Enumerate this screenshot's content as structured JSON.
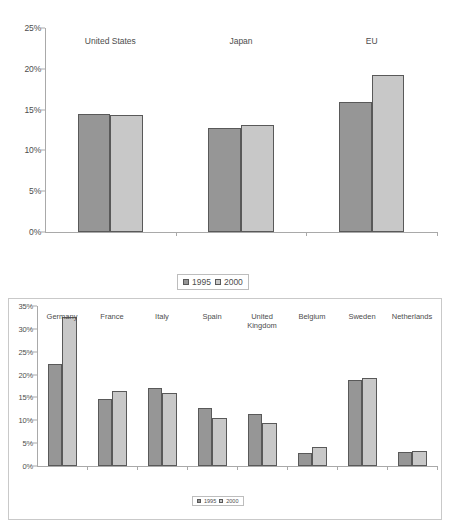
{
  "chart_data": [
    {
      "id": "top",
      "type": "bar",
      "title": "",
      "xlabel": "",
      "ylabel": "",
      "categories": [
        "United States",
        "Japan",
        "EU"
      ],
      "series": [
        {
          "name": "1995",
          "color": "#969696",
          "values": [
            14.4,
            12.7,
            15.9
          ]
        },
        {
          "name": "2000",
          "color": "#c8c8c8",
          "values": [
            14.3,
            13.1,
            19.3
          ]
        }
      ],
      "ylim": [
        0,
        25
      ],
      "ytick_values": [
        0,
        5,
        10,
        15,
        20,
        25
      ],
      "ytick_labels": [
        "0%",
        "5%",
        "10%",
        "15%",
        "20%",
        "25%"
      ],
      "grid": false,
      "legend_position": "bottom-center",
      "framed": false
    },
    {
      "id": "bottom",
      "type": "bar",
      "title": "",
      "xlabel": "",
      "ylabel": "",
      "categories": [
        "Germany",
        "France",
        "Italy",
        "Spain",
        "United\nKingdom",
        "Belgium",
        "Sweden",
        "Netherlands"
      ],
      "series": [
        {
          "name": "1995",
          "color": "#969696",
          "values": [
            22.3,
            14.6,
            17.0,
            12.7,
            11.3,
            2.9,
            18.8,
            3.1
          ]
        },
        {
          "name": "2000",
          "color": "#c8c8c8",
          "values": [
            32.5,
            16.3,
            16.0,
            10.6,
            9.5,
            4.1,
            19.2,
            3.2
          ]
        }
      ],
      "ylim": [
        0,
        35
      ],
      "ytick_values": [
        0,
        5,
        10,
        15,
        20,
        25,
        30,
        35
      ],
      "ytick_labels": [
        "0%",
        "5%",
        "10%",
        "15%",
        "20%",
        "25%",
        "30%",
        "35%"
      ],
      "grid": false,
      "legend_position": "inside-bottom-center",
      "framed": true
    }
  ],
  "colors": {
    "series_1995": "#969696",
    "series_2000": "#c8c8c8",
    "bar_outline": "#595959",
    "axis": "#a9a9a9",
    "text": "#4d4d4d",
    "frame": "#c9c9c9",
    "background": "#ffffff"
  }
}
